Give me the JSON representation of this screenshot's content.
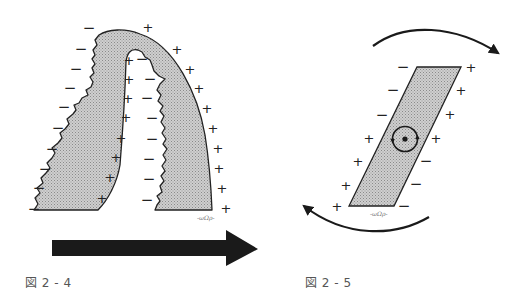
{
  "figures": [
    {
      "id": "fig-2-4",
      "caption": "図 2 - 4",
      "description": "Arch-shaped shaded band with jagged inner/outer edges; negative charges along jagged edges, positive charges along smooth edges; large arrow pointing right below",
      "outer_left_signs": [
        "−",
        "−",
        "−",
        "−",
        "−",
        "−",
        "−",
        "−",
        "−",
        "−"
      ],
      "inner_left_signs": [
        "+",
        "+",
        "+",
        "+",
        "+",
        "+",
        "+",
        "+"
      ],
      "inner_right_signs": [
        "−",
        "−",
        "−",
        "−",
        "−",
        "−",
        "−",
        "−"
      ],
      "outer_right_signs": [
        "+",
        "+",
        "+",
        "+",
        "+",
        "+",
        "+",
        "+",
        "+",
        "+",
        "+",
        "+"
      ],
      "signature": "-ωΩρ-",
      "arrow_direction": "right",
      "colors": {
        "fill": "#c8c8c8",
        "stroke": "#222222",
        "arrow": "#1a1a1a"
      }
    },
    {
      "id": "fig-2-5",
      "caption": "図 2 - 5",
      "description": "Tilted parallelogram with positive charges on the upper-right and lower-left, negative charges on the upper-left and lower-right; central circular rotation symbol; curved arrows indicating clockwise rotation",
      "left_edge_signs": [
        "−",
        "−",
        "−",
        "+",
        "+",
        "+",
        "+"
      ],
      "right_edge_signs": [
        "+",
        "+",
        "+",
        "+",
        "−",
        "−",
        "−"
      ],
      "signature": "-ωΩρ-",
      "rotation": "clockwise",
      "colors": {
        "fill": "#c8c8c8",
        "stroke": "#222222",
        "arrow": "#1a1a1a"
      }
    }
  ]
}
